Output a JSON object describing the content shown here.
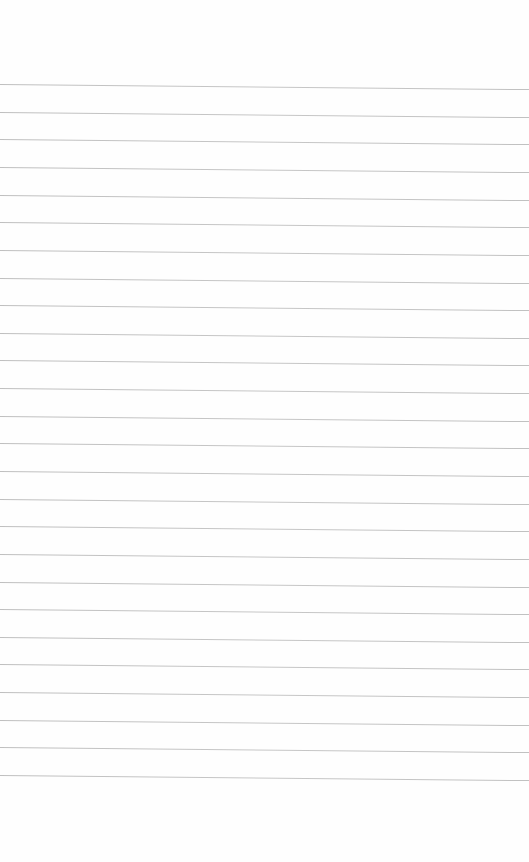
{
  "page": {
    "type": "lined-paper",
    "background": "#fefefe",
    "line_color": "#b8b8b8",
    "first_line_y": 84,
    "line_spacing": 27.64,
    "line_count": 26,
    "line_tilt_deg": 0.55
  }
}
